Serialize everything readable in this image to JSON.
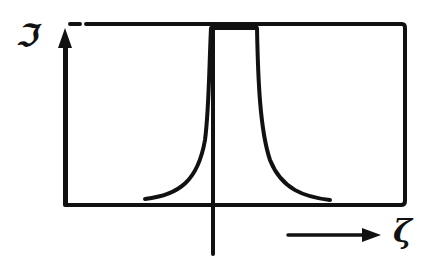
{
  "diagram": {
    "type": "hand-drawn sketch",
    "y_axis_label": "ℑ",
    "x_axis_label": "ζ",
    "colors": {
      "ink": "#111111",
      "background": "#ffffff"
    }
  }
}
